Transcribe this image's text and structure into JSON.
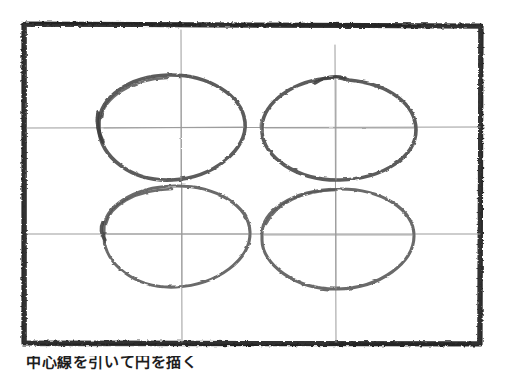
{
  "document": {
    "kind": "scanned-handdrawn-figure",
    "page_background": "#ffffff",
    "width": 506,
    "height": 374,
    "caption": {
      "text": "中心線を引いて円を描く",
      "clipped": "true",
      "note": "cut off at page bottom edge"
    }
  },
  "frame": {
    "label": "hand-drawn rectangular border",
    "ink_color": "#2a2a2a",
    "x": 22,
    "y": 22,
    "width": 460,
    "height": 323,
    "stroke_width": 5
  },
  "guides": {
    "label": "faint pencil construction crosshairs",
    "ink_color": "#9a9a9a",
    "horizontal": [
      {
        "name": "upper-axis",
        "y": 128,
        "x1": 26,
        "x2": 480
      },
      {
        "name": "lower-axis",
        "y": 234,
        "x1": 26,
        "x2": 480
      }
    ],
    "vertical": [
      {
        "name": "left-axis",
        "x": 181,
        "y1": 30,
        "y2": 342
      },
      {
        "name": "right-axis",
        "x": 335,
        "y1": 45,
        "y2": 342
      }
    ]
  },
  "ellipses": [
    {
      "name": "ellipse-top-left",
      "position": "top-left",
      "cx": 171,
      "cy": 128,
      "rx": 74,
      "ry": 54,
      "ink_color": "#5a5a5a",
      "stroke_width": 3.4,
      "overlap_point": "left"
    },
    {
      "name": "ellipse-top-right",
      "position": "top-right",
      "cx": 339,
      "cy": 128,
      "rx": 77,
      "ry": 53,
      "ink_color": "#5a5a5a",
      "stroke_width": 3.4,
      "overlap_point": "top"
    },
    {
      "name": "ellipse-bottom-left",
      "position": "bottom-left",
      "cx": 176,
      "cy": 236,
      "rx": 74,
      "ry": 51,
      "ink_color": "#6a6a6a",
      "stroke_width": 3.0,
      "overlap_point": "left"
    },
    {
      "name": "ellipse-bottom-right",
      "position": "bottom-right",
      "cx": 338,
      "cy": 238,
      "rx": 76,
      "ry": 51,
      "ink_color": "#6a6a6a",
      "stroke_width": 3.0,
      "overlap_point": "none"
    }
  ]
}
